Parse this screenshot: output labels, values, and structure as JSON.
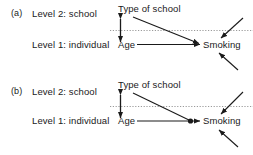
{
  "figure": {
    "caption_a": "(a)",
    "caption_b": "(b)",
    "background_color": "#ffffff",
    "line_color": "#1a1a1a",
    "dotted_line_color": "#999999"
  },
  "panels": [
    {
      "tag": "(a)",
      "level2_label": "Level 2: school",
      "level1_label": "Level 1: individual",
      "nodes": {
        "type_of_school": "Type of school",
        "age": "Age",
        "smoking": "Smoking"
      },
      "icons": {
        "cross_level_arrow": "double-headed-vertical-arrow",
        "level_divider": "horizontal-dotted-line",
        "main_effect_path": "age-to-smoking-arrow",
        "cross_level_path": "type-of-school-to-smoking-arrow",
        "residual_upper": "incoming-residual-arrow",
        "residual_lower": "incoming-residual-arrow"
      }
    },
    {
      "tag": "(b)",
      "level2_label": "Level 2: school",
      "level1_label": "Level 1: individual",
      "nodes": {
        "type_of_school": "Type of school",
        "age": "Age",
        "smoking": "Smoking"
      },
      "icons": {
        "cross_level_arrow": "double-headed-vertical-arrow",
        "level_divider": "horizontal-dotted-line",
        "main_effect_path": "age-to-smoking-arrow",
        "cross_level_path": "type-of-school-to-interaction-arrow",
        "interaction_node": "filled-dot-interaction-marker",
        "residual_upper": "incoming-residual-arrow",
        "residual_lower": "incoming-residual-arrow"
      }
    }
  ]
}
